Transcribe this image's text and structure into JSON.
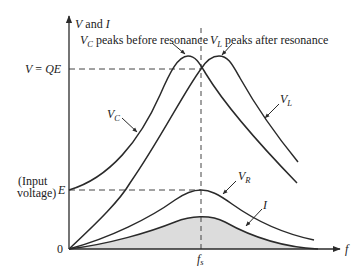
{
  "diagram": {
    "y_axis_label": {
      "v": "V",
      "and": " and ",
      "i": "I"
    },
    "x_axis_label": "f",
    "resonance_label": {
      "base": "f",
      "sub": "s"
    },
    "origin_label": "0",
    "level_qe": {
      "v": "V",
      "eq": " = ",
      "qe": "QE"
    },
    "level_e": "E",
    "input_voltage_line1": "(Input",
    "input_voltage_line2": "voltage)",
    "annotations": {
      "vc_peak": {
        "base": "V",
        "sub": "C",
        "text": " peaks before resonance"
      },
      "vl_peak": {
        "base": "V",
        "sub": "L",
        "text": " peaks after resonance"
      }
    },
    "curve_labels": {
      "vc": {
        "base": "V",
        "sub": "C"
      },
      "vl": {
        "base": "V",
        "sub": "L"
      },
      "vr": {
        "base": "V",
        "sub": "R"
      },
      "i": "I"
    },
    "colors": {
      "line": "#2a2a2a",
      "shade": "#dcdcdc",
      "dash": "#444444"
    }
  }
}
